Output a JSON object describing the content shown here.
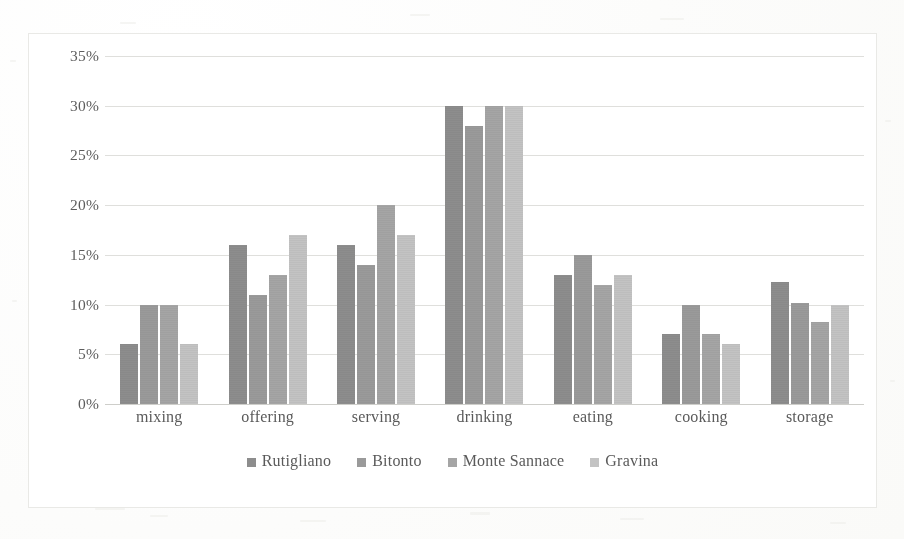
{
  "chart_data": {
    "type": "bar",
    "title": "",
    "xlabel": "",
    "ylabel": "",
    "categories": [
      "mixing",
      "offering",
      "serving",
      "drinking",
      "eating",
      "cooking",
      "storage"
    ],
    "series": [
      {
        "name": "Rutigliano",
        "color": "#8d8d8d",
        "values": [
          6,
          16,
          16,
          30,
          13,
          7,
          12.3
        ]
      },
      {
        "name": "Bitonto",
        "color": "#9a9a9a",
        "values": [
          10,
          11,
          14,
          28,
          15,
          10,
          10.2
        ]
      },
      {
        "name": "Monte Sannace",
        "color": "#a5a5a5",
        "values": [
          10,
          13,
          20,
          30,
          12,
          7,
          8.2
        ]
      },
      {
        "name": "Gravina",
        "color": "#c3c3c3",
        "values": [
          6,
          17,
          17,
          30,
          13,
          6,
          10
        ]
      }
    ],
    "ylim": [
      0,
      35
    ],
    "ytick_step": 5,
    "ytick_labels": [
      "0%",
      "5%",
      "10%",
      "15%",
      "20%",
      "25%",
      "30%",
      "35%"
    ],
    "ytick_values": [
      0,
      5,
      10,
      15,
      20,
      25,
      30,
      35
    ],
    "grid": true,
    "legend_position": "bottom",
    "value_suffix": "%"
  }
}
